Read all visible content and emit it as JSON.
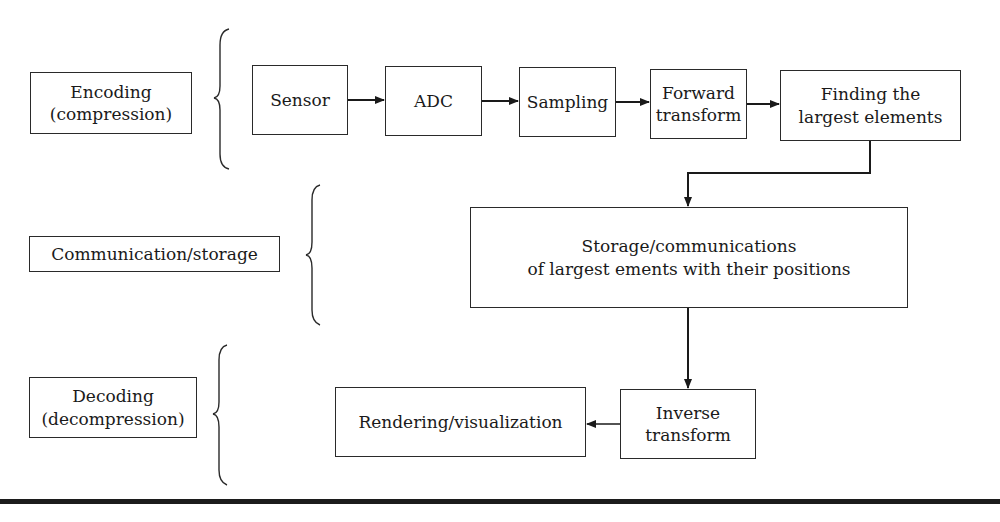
{
  "stages": {
    "encoding": {
      "label": "Encoding\n(compression)"
    },
    "communication": {
      "label": "Communication/storage"
    },
    "decoding": {
      "label": "Decoding\n(decompression)"
    }
  },
  "encoding_chain": {
    "sensor": "Sensor",
    "adc": "ADC",
    "sampling": "Sampling",
    "forward_transform": "Forward\ntransform",
    "finding": "Finding the\nlargest elements"
  },
  "storage": {
    "label": "Storage/communications\nof largest ements with their positions"
  },
  "decoding_chain": {
    "inverse_transform": "Inverse\ntransform",
    "rendering": "Rendering/visualization"
  },
  "colors": {
    "line": "#2a2a2a",
    "background": "#ffffff",
    "rule": "#1c1c1c"
  }
}
